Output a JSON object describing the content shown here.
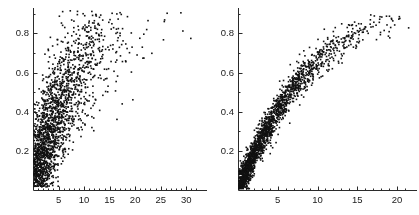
{
  "figure": {
    "type": "scatter-pair",
    "width": 419,
    "height": 215,
    "background": "#ffffff",
    "point_color": "#111111",
    "axis_color": "#2b2b2b"
  },
  "chart_data": [
    {
      "type": "scatter",
      "panel": "left",
      "title": "",
      "xlabel": "",
      "ylabel": "",
      "xlim": [
        0,
        32.5
      ],
      "ylim": [
        0,
        0.93
      ],
      "xticks": [
        5,
        10,
        15,
        20,
        25,
        30
      ],
      "xtick_labels": [
        "5",
        "10",
        "15",
        "20",
        "25",
        "30"
      ],
      "yticks": [
        0.2,
        0.4,
        0.6,
        0.8
      ],
      "ytick_labels": [
        "0.2",
        "0.4",
        "0.6",
        "0.8"
      ],
      "minor_xticks": [
        1,
        2,
        3,
        4,
        6,
        7,
        8,
        9,
        11,
        12,
        13,
        14,
        16,
        17,
        18,
        19,
        21,
        22,
        23,
        24,
        26,
        27,
        28,
        29,
        31,
        32
      ],
      "minor_yticks": [
        0.1,
        0.3,
        0.5,
        0.7,
        0.9
      ],
      "grid": false,
      "legend": null,
      "n_points": 1850,
      "marker_size": 1.6,
      "description": "Diffuse positively-sloped scatter cloud, very dense near the origin at low x and low y, broad vertical spread, thinning sparse tail extending to x=32",
      "distribution": {
        "x_mode": "exponential",
        "x_scale": 4.6,
        "y_given_x": "saturating",
        "y_asymptote": 0.95,
        "y_rate": 0.115,
        "y_noise_sd": 0.165,
        "y_floor": 0.02,
        "y_ceiling": 0.92
      },
      "series": [
        {
          "name": "observations",
          "x": [
            0.2,
            0.3,
            0.4,
            0.5,
            0.6,
            0.8,
            0.9,
            1.1,
            1.2,
            1.4,
            1.6,
            1.8,
            2.0,
            2.3,
            2.6,
            2.9,
            3.2,
            3.6,
            4.0,
            4.5,
            5.0,
            5.6,
            6.2,
            7.0,
            7.8,
            8.7,
            9.7,
            10.8,
            12.0,
            13.4,
            15.0,
            16.8,
            18.7,
            20.9,
            23.3,
            26.0,
            29.0,
            31.5
          ],
          "y_mean": [
            0.11,
            0.13,
            0.15,
            0.17,
            0.19,
            0.21,
            0.23,
            0.25,
            0.26,
            0.28,
            0.3,
            0.32,
            0.34,
            0.36,
            0.38,
            0.4,
            0.42,
            0.44,
            0.46,
            0.48,
            0.5,
            0.52,
            0.54,
            0.56,
            0.58,
            0.6,
            0.62,
            0.64,
            0.66,
            0.68,
            0.7,
            0.72,
            0.73,
            0.75,
            0.76,
            0.77,
            0.78,
            0.79
          ],
          "count_per_bin": [
            180,
            165,
            150,
            140,
            130,
            120,
            110,
            100,
            92,
            85,
            78,
            70,
            64,
            58,
            52,
            46,
            41,
            36,
            32,
            28,
            24,
            21,
            18,
            15,
            13,
            11,
            9,
            8,
            7,
            6,
            5,
            4,
            4,
            3,
            3,
            2,
            2,
            2
          ]
        }
      ]
    },
    {
      "type": "scatter",
      "panel": "right",
      "title": "",
      "xlabel": "",
      "ylabel": "",
      "xlim": [
        0,
        21.5
      ],
      "ylim": [
        0,
        0.93
      ],
      "xticks": [
        5,
        10,
        15,
        20
      ],
      "xtick_labels": [
        "5",
        "10",
        "15",
        "20"
      ],
      "yticks": [
        0.2,
        0.4,
        0.6,
        0.8
      ],
      "ytick_labels": [
        "0.2",
        "0.4",
        "0.6",
        "0.8"
      ],
      "minor_xticks": [
        1,
        2,
        3,
        4,
        6,
        7,
        8,
        9,
        11,
        12,
        13,
        14,
        16,
        17,
        18,
        19,
        21
      ],
      "minor_yticks": [
        0.1,
        0.3,
        0.5,
        0.7,
        0.9
      ],
      "grid": false,
      "legend": null,
      "n_points": 1850,
      "marker_size": 1.6,
      "description": "Tight concave-down saturating band rising steeply from the origin and flattening near y=0.85 at x=21; narrow vertical scatter around the curve",
      "distribution": {
        "x_mode": "exponential",
        "x_scale": 4.6,
        "y_given_x": "saturating",
        "y_asymptote": 1.02,
        "y_rate": 0.105,
        "y_noise_sd": 0.045,
        "y_floor": 0.01,
        "y_ceiling": 0.9
      },
      "series": [
        {
          "name": "observations",
          "x": [
            0.2,
            0.4,
            0.6,
            0.9,
            1.2,
            1.5,
            1.9,
            2.3,
            2.8,
            3.3,
            3.9,
            4.5,
            5.2,
            6.0,
            6.8,
            7.7,
            8.7,
            9.8,
            11.0,
            12.3,
            13.7,
            15.2,
            16.8,
            18.5,
            20.3,
            21.2
          ],
          "y_mean": [
            0.03,
            0.05,
            0.07,
            0.1,
            0.13,
            0.16,
            0.19,
            0.23,
            0.27,
            0.31,
            0.35,
            0.39,
            0.43,
            0.47,
            0.51,
            0.55,
            0.59,
            0.63,
            0.66,
            0.7,
            0.73,
            0.76,
            0.79,
            0.81,
            0.83,
            0.84
          ],
          "count_per_bin": [
            170,
            160,
            148,
            136,
            124,
            112,
            102,
            92,
            82,
            73,
            65,
            58,
            51,
            45,
            39,
            34,
            29,
            25,
            21,
            18,
            15,
            12,
            10,
            8,
            6,
            5
          ]
        }
      ]
    }
  ]
}
